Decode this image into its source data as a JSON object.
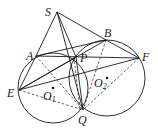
{
  "diagram": {
    "type": "geometry",
    "points": {
      "S": {
        "label": "S",
        "x": 57,
        "y": 12
      },
      "A": {
        "label": "A",
        "x": 36,
        "y": 56
      },
      "B": {
        "label": "B",
        "x": 106,
        "y": 40
      },
      "P": {
        "label": "P",
        "x": 76,
        "y": 57
      },
      "F": {
        "label": "F",
        "x": 139,
        "y": 58
      },
      "E": {
        "label": "E",
        "x": 19,
        "y": 90
      },
      "Q": {
        "label": "Q",
        "x": 83,
        "y": 110
      },
      "O1": {
        "label": "O",
        "sub": "1",
        "x": 53,
        "y": 88
      },
      "O2": {
        "label": "O",
        "sub": "2",
        "x": 107,
        "y": 78
      }
    },
    "circles": [
      {
        "name": "circle-O1",
        "cx": 53,
        "cy": 88,
        "r": 35
      },
      {
        "name": "circle-O2",
        "cx": 107,
        "cy": 78,
        "r": 38
      }
    ],
    "colors": {
      "stroke": "#1a1a1a",
      "background": "#ffffff"
    }
  }
}
